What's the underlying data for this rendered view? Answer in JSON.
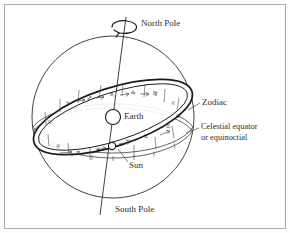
{
  "figure": {
    "background_color": "#fdfdfc",
    "frame_color": "#a8a8a8",
    "ink_color": "#1a1a1a"
  },
  "labels": {
    "north_pole": "North Pole",
    "south_pole": "South Pole",
    "zodiac": "Zodiac",
    "celestial_equator_line1": "Celestial equator",
    "celestial_equator_line2": "or equinoctial",
    "earth": "Earth",
    "sun": "Sun"
  },
  "bodies": {
    "earth": {
      "name": "Earth",
      "cx": 113,
      "cy": 117,
      "r": 7.5
    },
    "sun": {
      "name": "Sun",
      "cx": 112,
      "cy": 146,
      "r": 3.6
    }
  },
  "axis": {
    "name": "polar-axis",
    "north_end": {
      "x": 126,
      "y": 17
    },
    "south_end": {
      "x": 100,
      "y": 215
    },
    "rotation_direction": "counterclockwise-viewed-from-north"
  },
  "zodiac_signs": [
    {
      "symbol": "♏",
      "name": "Scorpio",
      "x": 112,
      "y": 95
    },
    {
      "symbol": "♎",
      "name": "Libra",
      "x": 133,
      "y": 93
    },
    {
      "symbol": "♍",
      "name": "Virgo",
      "x": 155,
      "y": 94
    },
    {
      "symbol": "♌",
      "name": "Leo",
      "x": 173,
      "y": 104
    },
    {
      "symbol": "♋",
      "name": "Cancer",
      "x": 178,
      "y": 117
    },
    {
      "symbol": "♊",
      "name": "Gemini",
      "x": 168,
      "y": 127
    },
    {
      "symbol": "♐",
      "name": "Sagittarius",
      "x": 89,
      "y": 99
    },
    {
      "symbol": "♑",
      "name": "Capricorn",
      "x": 68,
      "y": 104
    },
    {
      "symbol": "♈",
      "name": "Aries",
      "x": 50,
      "y": 123
    },
    {
      "symbol": "♓",
      "name": "Pisces",
      "x": 58,
      "y": 147
    },
    {
      "symbol": "♒",
      "name": "Aquarius",
      "x": 78,
      "y": 153
    },
    {
      "symbol": "♉",
      "name": "Taurus",
      "x": 146,
      "y": 137
    }
  ],
  "equator_glyphs": [
    {
      "symbol": "♓",
      "name": "pisces-lower",
      "x": 98,
      "y": 150
    },
    {
      "symbol": "♈",
      "name": "aries-lower",
      "x": 128,
      "y": 142
    }
  ]
}
